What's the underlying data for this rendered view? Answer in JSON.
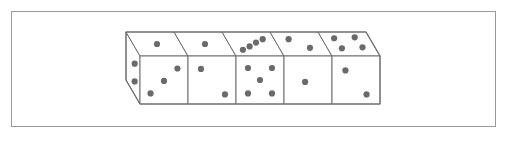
{
  "figure": {
    "canvas": {
      "width": 505,
      "height": 141
    },
    "colors": {
      "background": "#ffffff",
      "frame_stroke": "#9a9a9a",
      "die_stroke": "#6e6e6e",
      "die_fill": "#ffffff",
      "pip_fill": "#6a6a6a"
    },
    "frame": {
      "x": 11,
      "y": 11,
      "width": 484,
      "height": 115,
      "stroke_width": 1
    },
    "block": {
      "die_count": 5,
      "front_face_origin": {
        "x": 140,
        "y": 56
      },
      "face_size": 48,
      "depth_dx": -14,
      "depth_dy": -24,
      "pip_radius": 3.1
    },
    "dice": [
      {
        "index": 1,
        "label": "die-1",
        "top_value": 1,
        "front_value": 3,
        "left_value": 2,
        "top_pips": [
          [
            0.5,
            0.5
          ]
        ],
        "front_pips": [
          [
            0.78,
            0.26
          ],
          [
            0.5,
            0.52
          ],
          [
            0.22,
            0.78
          ]
        ],
        "left_pips": [
          [
            0.38,
            0.35
          ],
          [
            0.38,
            0.72
          ]
        ]
      },
      {
        "index": 2,
        "label": "die-2",
        "top_value": 1,
        "front_value": 2,
        "left_value": null,
        "top_pips": [
          [
            0.5,
            0.5
          ]
        ],
        "front_pips": [
          [
            0.27,
            0.27
          ],
          [
            0.77,
            0.8
          ]
        ],
        "left_pips": []
      },
      {
        "index": 3,
        "label": "die-3",
        "top_value": 4,
        "front_value": 5,
        "left_value": null,
        "top_pips": [
          [
            0.22,
            0.74
          ],
          [
            0.4,
            0.6
          ],
          [
            0.58,
            0.44
          ],
          [
            0.76,
            0.3
          ]
        ],
        "front_pips": [
          [
            0.25,
            0.25
          ],
          [
            0.75,
            0.25
          ],
          [
            0.5,
            0.5
          ],
          [
            0.25,
            0.78
          ],
          [
            0.75,
            0.78
          ]
        ],
        "left_pips": []
      },
      {
        "index": 4,
        "label": "die-4",
        "top_value": 2,
        "front_value": 1,
        "left_value": null,
        "top_pips": [
          [
            0.3,
            0.3
          ],
          [
            0.64,
            0.66
          ]
        ],
        "front_pips": [
          [
            0.44,
            0.54
          ]
        ],
        "left_pips": []
      },
      {
        "index": 5,
        "label": "die-5",
        "top_value": 4,
        "front_value": 2,
        "left_value": null,
        "top_pips": [
          [
            0.26,
            0.26
          ],
          [
            0.7,
            0.22
          ],
          [
            0.3,
            0.68
          ],
          [
            0.74,
            0.64
          ]
        ],
        "front_pips": [
          [
            0.28,
            0.3
          ],
          [
            0.72,
            0.8
          ]
        ],
        "left_pips": []
      }
    ],
    "totals": {
      "top_face_sum": 12,
      "front_face_sum": 13,
      "left_face_sum": 2
    }
  }
}
